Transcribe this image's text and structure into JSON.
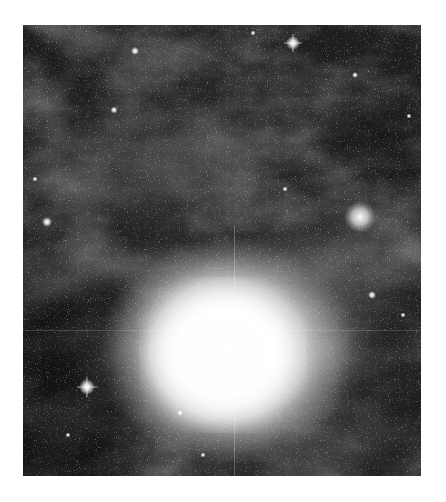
{
  "image": {
    "subject": "reflection nebula star field",
    "palette": "grayscale",
    "frame": {
      "left": 23,
      "top": 25,
      "width": 398,
      "height": 451
    },
    "colors": {
      "page": "#ffffff",
      "sky": "#1c1c1c",
      "glow": "#ffffff",
      "haze": "#8a8a8a"
    },
    "features": [
      {
        "name": "bright-nebula-core",
        "cx": 200,
        "cy": 325,
        "r": 85
      },
      {
        "name": "globular-cluster",
        "cx": 360,
        "cy": 217,
        "r": 10
      },
      {
        "name": "bright-star-top",
        "cx": 293,
        "cy": 43
      },
      {
        "name": "bright-star-left",
        "cx": 47,
        "cy": 222
      },
      {
        "name": "bright-star-lower-left",
        "cx": 87,
        "cy": 387
      },
      {
        "name": "star-right",
        "cx": 372,
        "cy": 295
      },
      {
        "name": "star-upper-left",
        "cx": 135,
        "cy": 51
      },
      {
        "name": "star-mid-left",
        "cx": 114,
        "cy": 110
      }
    ]
  }
}
